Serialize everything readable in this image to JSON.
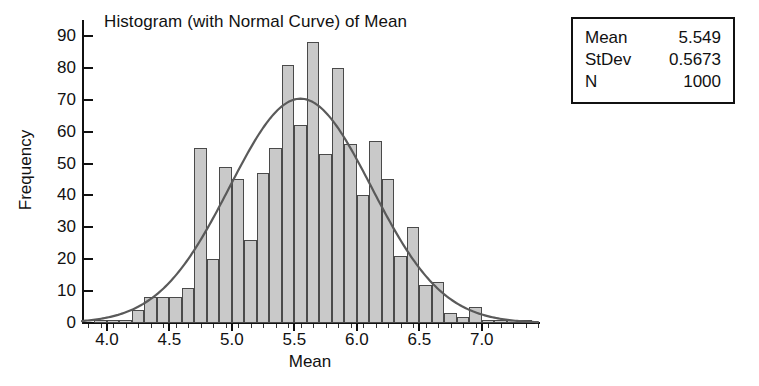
{
  "chart_data": {
    "type": "bar",
    "title": "Histogram (with Normal Curve) of Mean",
    "xlabel": "Mean",
    "ylabel": "Frequency",
    "xlim": [
      3.8,
      7.45
    ],
    "ylim": [
      0,
      95
    ],
    "grid": false,
    "legend": null,
    "bin_width": 0.1,
    "bin_centers": [
      3.85,
      3.95,
      4.05,
      4.15,
      4.25,
      4.35,
      4.45,
      4.55,
      4.65,
      4.75,
      4.85,
      4.95,
      5.05,
      5.15,
      5.25,
      5.35,
      5.45,
      5.55,
      5.65,
      5.75,
      5.85,
      5.95,
      6.05,
      6.15,
      6.25,
      6.35,
      6.45,
      6.55,
      6.65,
      6.75,
      6.85,
      6.95,
      7.05,
      7.15,
      7.25,
      7.35
    ],
    "categories": [
      "3.85",
      "3.95",
      "4.05",
      "4.15",
      "4.25",
      "4.35",
      "4.45",
      "4.55",
      "4.65",
      "4.75",
      "4.85",
      "4.95",
      "5.05",
      "5.15",
      "5.25",
      "5.35",
      "5.45",
      "5.55",
      "5.65",
      "5.75",
      "5.85",
      "5.95",
      "6.05",
      "6.15",
      "6.25",
      "6.35",
      "6.45",
      "6.55",
      "6.65",
      "6.75",
      "6.85",
      "6.95",
      "7.05",
      "7.15",
      "7.25",
      "7.35"
    ],
    "values": [
      0,
      1,
      1,
      1,
      4,
      8,
      8,
      8,
      11,
      55,
      20,
      49,
      45,
      26,
      47,
      55,
      81,
      62,
      88,
      53,
      80,
      56,
      40,
      57,
      45,
      21,
      30,
      12,
      13,
      3,
      2,
      5,
      1,
      1,
      1,
      1
    ],
    "xticks": [
      4.0,
      4.5,
      5.0,
      5.5,
      6.0,
      6.5,
      7.0
    ],
    "xtick_labels": [
      "4.0",
      "4.5",
      "5.0",
      "5.5",
      "6.0",
      "6.5",
      "7.0"
    ],
    "yticks": [
      0,
      10,
      20,
      30,
      40,
      50,
      60,
      70,
      80,
      90
    ],
    "ytick_labels": [
      "0",
      "10",
      "20",
      "30",
      "40",
      "50",
      "60",
      "70",
      "80",
      "90"
    ],
    "overlay_curve": {
      "type": "normal",
      "mean": 5.549,
      "stdev": 0.5673,
      "n": 1000,
      "bin_width": 0.1,
      "peak_value": 70.3,
      "color": "#5a5a5a"
    },
    "bar_fill_color": "#c9c9c9",
    "bar_edge_color": "#4a4a4a"
  },
  "stats_box": {
    "rows": [
      {
        "key": "Mean",
        "value": "5.549"
      },
      {
        "key": "StDev",
        "value": "0.5673"
      },
      {
        "key": "N",
        "value": "1000"
      }
    ]
  }
}
